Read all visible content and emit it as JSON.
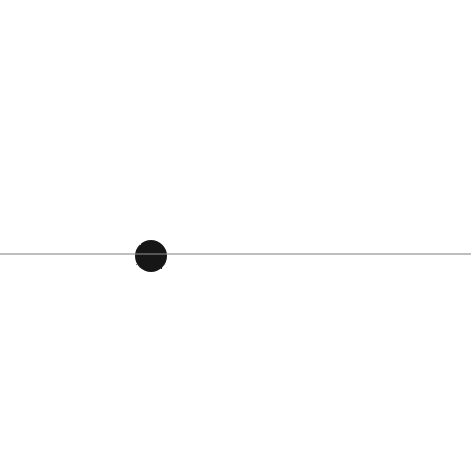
{
  "canvas": {
    "width": 471,
    "height": 464,
    "background_color": "#ffffff",
    "title": "Hand-drawn L-shaped axes with a filled dot",
    "description": "A white page bearing three thick dark marker strokes: a long vertical bar on the left, a long horizontal bar across the bottom crossing it, and a small solid filled circle in the middle-left area."
  },
  "palette": {
    "ink": "#171717",
    "ink_dark": "#0e0e0e",
    "ink_light": "#2a2a2a",
    "paper": "#ffffff",
    "seam": "#8a8a8a"
  },
  "shapes": [
    {
      "id": "vertical-stroke",
      "kind": "stroke",
      "name": "vertical-bar",
      "label": "Vertical stroke",
      "x1": 69,
      "y1": 42,
      "x2": 69,
      "y2": 437,
      "thickness": 20,
      "length": 395,
      "cap": "round",
      "color": "#171717"
    },
    {
      "id": "horizontal-stroke",
      "kind": "stroke",
      "name": "horizontal-bar",
      "label": "Horizontal stroke",
      "x1": 41,
      "y1": 403,
      "x2": 418,
      "y2": 403,
      "thickness": 20,
      "length": 377,
      "cap": "round",
      "color": "#171717"
    },
    {
      "id": "dot-mark",
      "kind": "circle",
      "name": "filled-dot",
      "label": "Filled dot",
      "cx": 151,
      "cy": 256,
      "r": 16,
      "color": "#171717"
    }
  ],
  "artifacts": [
    {
      "id": "scan-seam",
      "name": "scan-seam-line",
      "label": "Horizontal scan seam",
      "y": 254,
      "x_start": 0,
      "x_end": 471,
      "thickness": 2,
      "color": "#8a8a8a",
      "opacity": 0.55
    }
  ],
  "intersection": {
    "label": "Crossing point",
    "x": 69,
    "y": 403
  },
  "caption": {
    "visible": false,
    "text": ""
  }
}
